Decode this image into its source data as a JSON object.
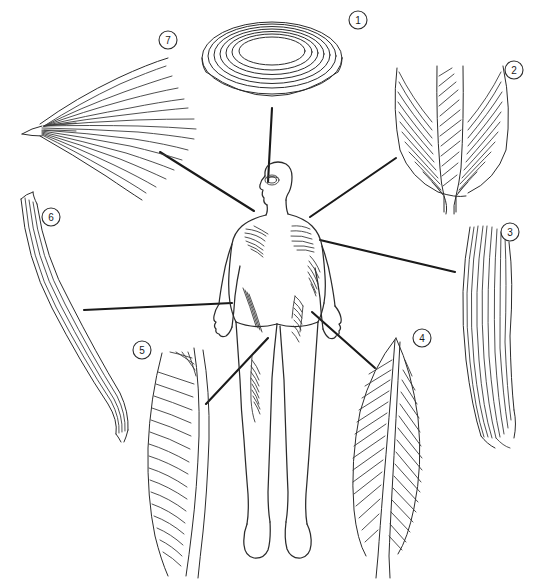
{
  "figure": {
    "background_color": "#ffffff",
    "line_color": "#2b2b2b",
    "width": 557,
    "height": 579
  },
  "central_subject": {
    "name": "human body outline",
    "description": "Anterior view human figure with highlighted muscle regions",
    "highlighted_regions": [
      "eye / orbicularis oculi",
      "chest / pectoralis major",
      "shoulder / deltoid",
      "upper arm / biceps brachii",
      "thigh / sartorius",
      "thigh / rectus femoris",
      "lower leg / gastrocnemius"
    ]
  },
  "callouts": [
    {
      "number": "1",
      "muscle_type": "circular",
      "label_x": 358,
      "label_y": 20,
      "shape": "concentric-rings",
      "target": "eye",
      "leader": {
        "x1": 272,
        "y1": 108,
        "x2": 268,
        "y2": 182
      }
    },
    {
      "number": "2",
      "muscle_type": "multipennate",
      "label_x": 514,
      "label_y": 70,
      "shape": "multipennate-feather",
      "target": "shoulder-deltoid",
      "leader": {
        "x1": 396,
        "y1": 158,
        "x2": 310,
        "y2": 217
      }
    },
    {
      "number": "3",
      "muscle_type": "fusiform",
      "label_x": 510,
      "label_y": 232,
      "shape": "fusiform-spindle",
      "target": "upper-arm-biceps",
      "leader": {
        "x1": 455,
        "y1": 272,
        "x2": 320,
        "y2": 240
      }
    },
    {
      "number": "4",
      "muscle_type": "bipennate",
      "label_x": 422,
      "label_y": 338,
      "shape": "bipennate-leaf",
      "target": "thigh-rectus-femoris",
      "leader": {
        "x1": 375,
        "y1": 368,
        "x2": 312,
        "y2": 312
      }
    },
    {
      "number": "5",
      "muscle_type": "unipennate",
      "label_x": 142,
      "label_y": 350,
      "shape": "unipennate-oblique",
      "target": "lower-leg",
      "leader": {
        "x1": 206,
        "y1": 404,
        "x2": 268,
        "y2": 338
      }
    },
    {
      "number": "6",
      "muscle_type": "parallel",
      "label_x": 51,
      "label_y": 217,
      "shape": "parallel-strap",
      "target": "thigh-sartorius",
      "leader": {
        "x1": 84,
        "y1": 310,
        "x2": 232,
        "y2": 303
      }
    },
    {
      "number": "7",
      "muscle_type": "convergent",
      "label_x": 168,
      "label_y": 40,
      "shape": "convergent-fan",
      "target": "chest-pectoralis",
      "leader": {
        "x1": 160,
        "y1": 152,
        "x2": 254,
        "y2": 211
      }
    }
  ]
}
